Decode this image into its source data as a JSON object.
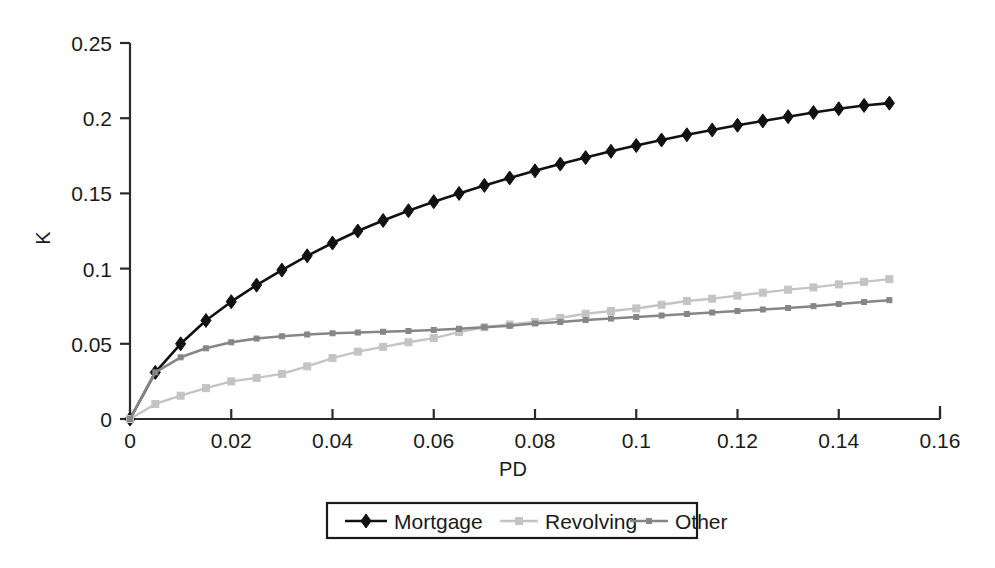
{
  "chart_data": {
    "type": "line",
    "title": "",
    "xlabel": "PD",
    "ylabel": "K",
    "xlim": [
      0,
      0.16
    ],
    "ylim": [
      0,
      0.25
    ],
    "grid": false,
    "legend_position": "bottom",
    "x_ticks": [
      0,
      0.02,
      0.04,
      0.06,
      0.08,
      0.1,
      0.12,
      0.14,
      0.16
    ],
    "x_tick_labels": [
      "0",
      "0.02",
      "0.04",
      "0.06",
      "0.08",
      "0.1",
      "0.12",
      "0.14",
      "0.16"
    ],
    "y_ticks": [
      0,
      0.05,
      0.1,
      0.15,
      0.2,
      0.25
    ],
    "y_tick_labels": [
      "0",
      "0.05",
      "0.1",
      "0.15",
      "0.2",
      "0.25"
    ],
    "x": [
      0,
      0.005,
      0.01,
      0.015,
      0.02,
      0.025,
      0.03,
      0.035,
      0.04,
      0.045,
      0.05,
      0.055,
      0.06,
      0.065,
      0.07,
      0.075,
      0.08,
      0.085,
      0.09,
      0.095,
      0.1,
      0.105,
      0.11,
      0.115,
      0.12,
      0.125,
      0.13,
      0.135,
      0.14,
      0.145,
      0.15
    ],
    "series": [
      {
        "name": "Mortgage",
        "color": "#111111",
        "marker": "diamond",
        "marker_size": 7,
        "line_width": 2.6,
        "values": [
          0.0,
          0.031,
          0.05,
          0.0655,
          0.078,
          0.089,
          0.099,
          0.1085,
          0.117,
          0.125,
          0.132,
          0.1385,
          0.1445,
          0.15,
          0.1553,
          0.1603,
          0.165,
          0.1695,
          0.1738,
          0.178,
          0.1818,
          0.1855,
          0.189,
          0.1922,
          0.1953,
          0.1982,
          0.201,
          0.2038,
          0.2063,
          0.2085,
          0.21
        ]
      },
      {
        "name": "Revolving",
        "color": "#c4c4c4",
        "marker": "square",
        "marker_size": 7,
        "line_width": 2.4,
        "values": [
          0.0,
          0.01,
          0.0155,
          0.0205,
          0.025,
          0.0273,
          0.03,
          0.035,
          0.0405,
          0.0448,
          0.048,
          0.051,
          0.0538,
          0.0578,
          0.061,
          0.0628,
          0.0645,
          0.0672,
          0.07,
          0.0718,
          0.0735,
          0.076,
          0.0785,
          0.08,
          0.082,
          0.084,
          0.086,
          0.0875,
          0.0895,
          0.0912,
          0.093
        ]
      },
      {
        "name": "Other",
        "color": "#868686",
        "marker": "square",
        "marker_size": 5,
        "line_width": 2.6,
        "values": [
          0.0,
          0.031,
          0.041,
          0.047,
          0.051,
          0.0535,
          0.055,
          0.0562,
          0.057,
          0.0575,
          0.058,
          0.0585,
          0.0592,
          0.06,
          0.061,
          0.062,
          0.0635,
          0.0645,
          0.0658,
          0.0668,
          0.0678,
          0.0688,
          0.0698,
          0.0708,
          0.0718,
          0.0728,
          0.0738,
          0.075,
          0.0765,
          0.0778,
          0.079
        ]
      }
    ]
  },
  "legend": {
    "entries": [
      {
        "label": "Mortgage"
      },
      {
        "label": "Revolving"
      },
      {
        "label": "Other"
      }
    ]
  },
  "colors": {
    "axis": "#2b2b2b",
    "text": "#1a1a1a",
    "background": "#ffffff",
    "mortgage": "#111111",
    "revolving": "#c4c4c4",
    "other": "#868686"
  }
}
